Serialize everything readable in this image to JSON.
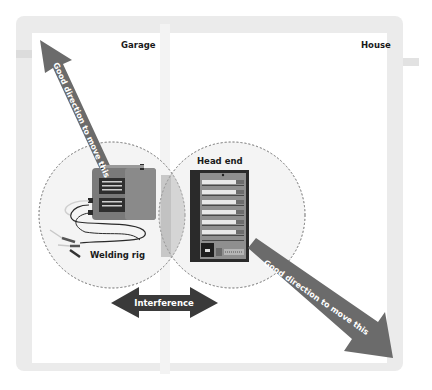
{
  "rooms": {
    "left": "Garage",
    "right": "House"
  },
  "devices": {
    "welder": {
      "label": "Welding rig"
    },
    "headend": {
      "label": "Head end"
    }
  },
  "arrows": {
    "up_left": "Good direction to move this",
    "down_right": "Good direction to move this",
    "interference": "Interference"
  },
  "colors": {
    "arrow_gray": "#6b6b6b",
    "interference_arrow": "#3a3a3a",
    "frame": "#ebebeb",
    "welder_body": "#7d7d7d",
    "overlap": "#c9c9c9"
  }
}
